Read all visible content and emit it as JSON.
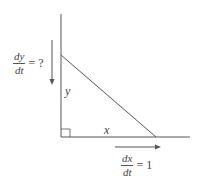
{
  "diagram": {
    "type": "related-rates right triangle",
    "colors": {
      "line": "#555555",
      "background": "#ffffff"
    },
    "labels": {
      "vertical_side": "y",
      "horizontal_side": "x"
    },
    "rates": {
      "dy_dt": {
        "numerator": "dy",
        "denominator": "dt",
        "equals": "= ?"
      },
      "dx_dt": {
        "numerator": "dx",
        "denominator": "dt",
        "equals": "= 1"
      }
    },
    "arrows": {
      "vertical": "down-arrow",
      "horizontal": "right-arrow"
    },
    "right_angle_marker": "square-corner"
  }
}
